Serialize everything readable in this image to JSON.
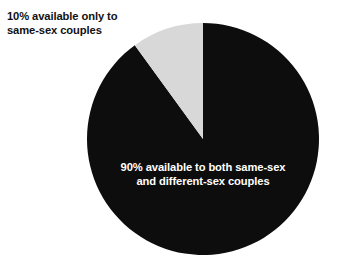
{
  "chart_data": {
    "type": "pie",
    "title": "",
    "subtitle": "",
    "xlabel": "",
    "ylabel": "",
    "grid": false,
    "legend_position": "none",
    "start_angle_deg": 0,
    "direction": "counterclockwise",
    "center": {
      "x": 203,
      "y": 139
    },
    "radius": 116,
    "categories": [
      "10% available only to same-sex couples",
      "90% available to both same-sex and different-sex couples"
    ],
    "values": [
      10,
      90
    ],
    "value_unit": "percent",
    "colors": [
      "#d8d8d8",
      "#0d0d0d"
    ],
    "slices": [
      {
        "name": "same-sex-only",
        "value": 10,
        "value_label": "10%",
        "color": "#d8d8d8",
        "label_text": "10% available only to\nsame-sex couples",
        "label_placement": "outside-top-left",
        "label_color": "#111111",
        "start_angle_deg": 0,
        "end_angle_deg": 36
      },
      {
        "name": "both-same-sex-and-different-sex",
        "value": 90,
        "value_label": "90%",
        "color": "#0d0d0d",
        "label_text": "90% available to both same-sex\nand different-sex couples",
        "label_placement": "inside-bottom-center",
        "label_color": "#ffffff",
        "start_angle_deg": 36,
        "end_angle_deg": 360
      }
    ],
    "annotations": [
      "10% available only to same-sex couples",
      "90% available to both same-sex and different-sex couples"
    ]
  },
  "figure": {
    "background_color": "#ffffff",
    "callout_label": "10% available only to\nsame-sex couples",
    "inner_label": "90% available to both same-sex\nand different-sex couples"
  }
}
